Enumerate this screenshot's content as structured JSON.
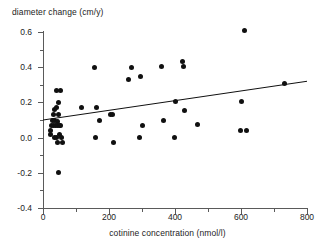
{
  "chart_data": {
    "type": "scatter",
    "title": "",
    "xlabel": "cotinine concentration (nmol/l)",
    "ylabel": "diameter change (cm/y)",
    "xlim": [
      0,
      800
    ],
    "ylim": [
      -0.4,
      0.6
    ],
    "xticks": [
      0,
      200,
      400,
      600,
      800
    ],
    "xticklabels": [
      "0",
      "200",
      "400",
      "600",
      "800"
    ],
    "xminorticks": [
      100,
      300,
      500,
      700
    ],
    "yticks": [
      -0.4,
      -0.2,
      0.0,
      0.2,
      0.4,
      0.6
    ],
    "yticklabels": [
      "-0.4",
      "-0.2",
      "0.0",
      "0.2",
      "0.4",
      "0.6"
    ],
    "yminorticks": [
      -0.3,
      -0.1,
      0.1,
      0.3,
      0.5
    ],
    "grid": false,
    "legend": false,
    "marker": "filled-circle",
    "marker_color": "#101010",
    "axis_color": "#5a5a5a",
    "points": [
      [
        22,
        0.04
      ],
      [
        24,
        0.02
      ],
      [
        27,
        0.07
      ],
      [
        30,
        0.1
      ],
      [
        32,
        0.13
      ],
      [
        33,
        0.07
      ],
      [
        34,
        0.0
      ],
      [
        35,
        0.16
      ],
      [
        36,
        0.1
      ],
      [
        38,
        0.07
      ],
      [
        40,
        0.27
      ],
      [
        41,
        0.17
      ],
      [
        42,
        0.0
      ],
      [
        43,
        0.09
      ],
      [
        44,
        0.07
      ],
      [
        45,
        -0.03
      ],
      [
        46,
        0.2
      ],
      [
        47,
        -0.2
      ],
      [
        48,
        0.13
      ],
      [
        49,
        0.07
      ],
      [
        50,
        0.02
      ],
      [
        52,
        0.27
      ],
      [
        54,
        0.07
      ],
      [
        56,
        0.0
      ],
      [
        58,
        -0.03
      ],
      [
        118,
        0.17
      ],
      [
        155,
        0.4
      ],
      [
        158,
        0.0
      ],
      [
        163,
        0.17
      ],
      [
        170,
        0.1
      ],
      [
        205,
        0.13
      ],
      [
        212,
        0.13
      ],
      [
        213,
        -0.03
      ],
      [
        258,
        0.33
      ],
      [
        268,
        0.4
      ],
      [
        292,
        0.0
      ],
      [
        296,
        0.35
      ],
      [
        300,
        0.07
      ],
      [
        358,
        0.405
      ],
      [
        366,
        0.1
      ],
      [
        398,
        0.0
      ],
      [
        403,
        0.205
      ],
      [
        423,
        0.43
      ],
      [
        425,
        0.405
      ],
      [
        428,
        0.155
      ],
      [
        468,
        0.075
      ],
      [
        597,
        0.04
      ],
      [
        601,
        0.205
      ],
      [
        612,
        0.61
      ],
      [
        618,
        0.04
      ],
      [
        731,
        0.305
      ]
    ],
    "trendline": {
      "type": "linear-fit",
      "x_start": 0,
      "y_start": 0.1,
      "x_end": 800,
      "y_end": 0.32,
      "color": "#101010"
    }
  }
}
